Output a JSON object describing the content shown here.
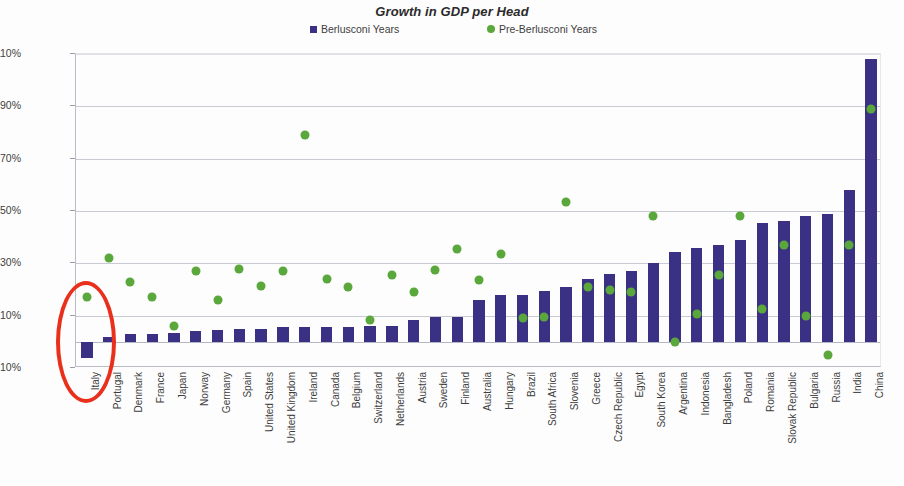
{
  "chart_data": {
    "type": "bar",
    "title": "Growth in GDP per Head",
    "xlabel": "",
    "ylabel": "",
    "ylim": [
      -10,
      110
    ],
    "ytick_labels": [
      "110%",
      "90%",
      "70%",
      "50%",
      "30%",
      "10%",
      "-10%"
    ],
    "ytick_values": [
      110,
      90,
      70,
      50,
      30,
      10,
      -10
    ],
    "grid": true,
    "legend_position": "top-center",
    "categories": [
      "Italy",
      "Portugal",
      "Denmark",
      "France",
      "Japan",
      "Norway",
      "Germany",
      "Spain",
      "United States",
      "United Kingdom",
      "Ireland",
      "Canada",
      "Belgium",
      "Switzerland",
      "Netherlands",
      "Austria",
      "Sweden",
      "Finland",
      "Australia",
      "Hungary",
      "Brazil",
      "South Africa",
      "Slovenia",
      "Greece",
      "Czech Republic",
      "Egypt",
      "South Korea",
      "Argentina",
      "Indonesia",
      "Bangladesh",
      "Poland",
      "Romania",
      "Slovak Republic",
      "Bulgaria",
      "Russia",
      "India",
      "China"
    ],
    "series": [
      {
        "name": "Berlusconi Years",
        "type": "bar",
        "color": "#3b3184",
        "values": [
          -6,
          2,
          3,
          3,
          3.5,
          4,
          4.5,
          5,
          5,
          5.5,
          5.5,
          5.5,
          5.5,
          6,
          6,
          8.5,
          9.5,
          9.5,
          16,
          18,
          18,
          19.5,
          21,
          24,
          26,
          27,
          30,
          34.5,
          36,
          37,
          39,
          45.5,
          46,
          48,
          49,
          58,
          108
        ]
      },
      {
        "name": "Pre-Berlusconi Years",
        "type": "scatter",
        "color": "#5aa83c",
        "values": [
          17,
          32,
          23,
          17,
          6,
          27,
          16,
          28,
          21.5,
          27,
          79,
          24,
          21,
          8.5,
          25.5,
          19,
          27.5,
          35.5,
          23.5,
          33.5,
          9,
          9.5,
          53.5,
          21,
          20,
          19,
          48,
          0,
          10.5,
          25.5,
          48,
          12.5,
          37,
          10,
          -5,
          37,
          89
        ]
      }
    ],
    "annotations": [
      {
        "name": "highlight-oval",
        "shape": "ellipse",
        "color": "#e8301c",
        "target_category": "Italy"
      }
    ]
  },
  "legend": {
    "entries": [
      {
        "label": "Berlusconi Years",
        "marker": "square",
        "color": "#3b3184"
      },
      {
        "label": "Pre-Berlusconi Years",
        "marker": "circle",
        "color": "#5aa83c"
      }
    ]
  }
}
